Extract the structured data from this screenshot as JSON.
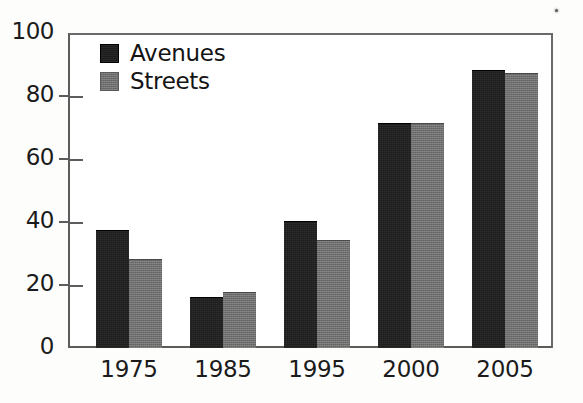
{
  "chart_data": {
    "type": "bar",
    "title": "",
    "subtitle": "",
    "xlabel": "",
    "ylabel": "",
    "categories": [
      "1975",
      "1985",
      "1995",
      "2000",
      "2005"
    ],
    "series": [
      {
        "name": "Avenues",
        "color": "#1c1c1c",
        "values": [
          37,
          16,
          40,
          71,
          88
        ]
      },
      {
        "name": "Streets",
        "color": "#6f6f6f",
        "values": [
          28,
          17.5,
          34,
          71,
          87
        ]
      }
    ],
    "ylim": [
      0,
      100
    ],
    "yticks": [
      0,
      20,
      40,
      60,
      80,
      100
    ],
    "ytick_labels": [
      "0",
      "20",
      "40",
      "60",
      "80",
      "100"
    ],
    "grid": false,
    "legend_position": "top-left-inside",
    "bar_group_mode": "grouped",
    "annotations": []
  },
  "figure": {
    "background_color": "#fdfdfc",
    "plot_background_color": "#ffffff",
    "axis_color": "#5c5c5c",
    "text_color": "#1b1b1b"
  },
  "legend": {
    "entries": [
      {
        "label": "Avenues"
      },
      {
        "label": "Streets"
      }
    ]
  }
}
